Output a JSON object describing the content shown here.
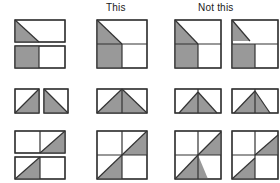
{
  "figure": {
    "kind": "instructional-diagram",
    "background_color": "#ffffff",
    "fill_color": "#999999",
    "stroke_color": "#333333",
    "columns": [
      {
        "id": "source",
        "label": ""
      },
      {
        "id": "good",
        "label": "This"
      },
      {
        "id": "bad",
        "label": "Not this"
      }
    ],
    "headers": {
      "this_label": "This",
      "not_this_label": "Not this"
    },
    "rows": [
      {
        "id": "row-1",
        "source": {
          "name": "stacked-rectangles-pair",
          "tiles": [
            {
              "name": "rect-diagonal-lower-left-shaded"
            },
            {
              "name": "rect-left-half-shaded"
            }
          ]
        },
        "good": {
          "name": "square-diagonal-continuous-correct"
        },
        "bad": [
          {
            "name": "square-diagonal-misaligned-1"
          },
          {
            "name": "square-diagonal-misaligned-2"
          }
        ]
      },
      {
        "id": "row-2",
        "source": {
          "name": "square-pair-mirrored-triangles",
          "tiles": [
            {
              "name": "square-triangle-lower-right-shaded"
            },
            {
              "name": "square-triangle-lower-left-shaded"
            }
          ]
        },
        "good": {
          "name": "rect-peak-triangle-correct"
        },
        "bad": [
          {
            "name": "rect-peak-triangle-misaligned-1"
          },
          {
            "name": "rect-peak-triangle-misaligned-2"
          }
        ]
      },
      {
        "id": "row-3",
        "source": {
          "name": "stacked-rectangles-quarter-diagonals",
          "tiles": [
            {
              "name": "rect-upper-right-diagonal-shaded"
            },
            {
              "name": "rect-lower-left-diagonal-shaded"
            }
          ]
        },
        "good": {
          "name": "square-full-diagonal-correct"
        },
        "bad": [
          {
            "name": "square-full-diagonal-misaligned-1"
          },
          {
            "name": "square-full-diagonal-misaligned-2"
          }
        ]
      }
    ]
  }
}
